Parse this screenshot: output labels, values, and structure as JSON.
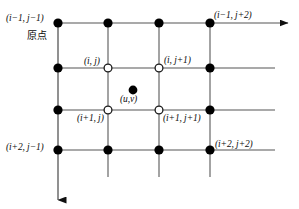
{
  "figure": {
    "kind": "staggered-grid-diagram",
    "background_color": "#ffffff",
    "line_color": "#8c8c8c",
    "axis_color": "#101010",
    "node_fill_color": "#000000",
    "node_open_fill": "#ffffff",
    "text_color": "#0d0d0d"
  },
  "labels": {
    "top_left": "(i−1, j−1)",
    "origin_cjk": "原点",
    "top_right": "(i−1, j+2)",
    "inner_top_left": "(i, j)",
    "inner_top_right": "(i, j+1)",
    "center_point": "(u,v)",
    "inner_bottom_left": "(i+1, j)",
    "inner_bottom_right": "(i+1, j+1)",
    "bottom_left": "(i+2, j−1)",
    "bottom_right": "(i+2, j+2)"
  },
  "grid": {
    "columns_x": [
      58,
      108,
      159,
      210
    ],
    "rows_y": [
      23,
      68,
      110,
      150
    ],
    "row_line_x_start": 58,
    "row_line_x_end": 275,
    "col_line_y_start": 23,
    "col_line_y_end": 177
  },
  "nodes": {
    "filled": [
      {
        "name": "node-i-1-j-1",
        "x": 58,
        "y": 23,
        "r": 4.6
      },
      {
        "name": "node-top-2",
        "x": 108,
        "y": 23,
        "r": 4.6
      },
      {
        "name": "node-top-3",
        "x": 159,
        "y": 23,
        "r": 4.6
      },
      {
        "name": "node-i-1-j-2",
        "x": 210,
        "y": 23,
        "r": 4.6
      },
      {
        "name": "node-left-row2",
        "x": 58,
        "y": 68,
        "r": 4.6
      },
      {
        "name": "node-right-row2",
        "x": 210,
        "y": 68,
        "r": 4.6
      },
      {
        "name": "node-left-row3",
        "x": 58,
        "y": 110,
        "r": 4.6
      },
      {
        "name": "node-right-row3",
        "x": 210,
        "y": 110,
        "r": 4.6
      },
      {
        "name": "node-i-2-j-1",
        "x": 58,
        "y": 150,
        "r": 4.6
      },
      {
        "name": "node-bottom-2",
        "x": 108,
        "y": 150,
        "r": 4.6
      },
      {
        "name": "node-bottom-3",
        "x": 159,
        "y": 150,
        "r": 4.6
      },
      {
        "name": "node-i-2-j-2",
        "x": 210,
        "y": 150,
        "r": 4.6
      }
    ],
    "open": [
      {
        "name": "node-i-j",
        "x": 108,
        "y": 68,
        "r": 3.9
      },
      {
        "name": "node-i-j-plus-1",
        "x": 159,
        "y": 68,
        "r": 3.9
      },
      {
        "name": "node-i-plus-1-j",
        "x": 108,
        "y": 110,
        "r": 3.9
      },
      {
        "name": "node-i-plus-1-j-plus-1",
        "x": 159,
        "y": 110,
        "r": 3.9
      }
    ],
    "center": {
      "name": "node-uv",
      "x": 133,
      "y": 90,
      "r": 4.4
    }
  },
  "axes": {
    "horizontal": {
      "name": "x-axis-arrow",
      "x1": 58,
      "y1": 23,
      "x2": 290,
      "y2": 23
    },
    "vertical": {
      "name": "y-axis-arrow",
      "x1": 58,
      "y1": 23,
      "x2": 58,
      "y2": 202
    }
  }
}
